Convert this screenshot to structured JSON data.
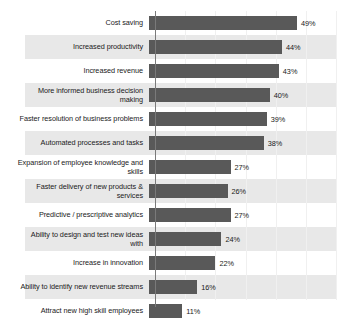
{
  "chart_data": {
    "type": "bar",
    "orientation": "horizontal",
    "title": "",
    "subtitle": "",
    "xlabel": "",
    "ylabel": "",
    "xlim": [
      0,
      60
    ],
    "grid": true,
    "legend": false,
    "value_suffix": "%",
    "categories": [
      "Cost saving",
      "Increased productivity",
      "Increased revenue",
      "More informed business decision making",
      "Faster resolution of business problems",
      "Automated processes and tasks",
      "Expansion of employee knowledge and skills",
      "Faster delivery of new products & services",
      "Predictive / prescriptive analytics",
      "Ability to design and test new ideas with",
      "Increase in innovation",
      "Ability to identify new revenue streams",
      "Attract new high skill employees"
    ],
    "values": [
      49,
      44,
      43,
      40,
      39,
      38,
      27,
      26,
      27,
      24,
      22,
      16,
      11
    ],
    "value_labels": [
      "49%",
      "44%",
      "43%",
      "40%",
      "39%",
      "38%",
      "27%",
      "26%",
      "27%",
      "24%",
      "22%",
      "16%",
      "11%"
    ],
    "category_lines": [
      [
        "Cost saving"
      ],
      [
        "Increased productivity"
      ],
      [
        "Increased revenue"
      ],
      [
        "More informed business decision",
        "making"
      ],
      [
        "Faster resolution of business problems"
      ],
      [
        "Automated processes and tasks"
      ],
      [
        "Expansion of employee knowledge and",
        "skills"
      ],
      [
        "Faster delivery of new products &",
        "services"
      ],
      [
        "Predictive / prescriptive analytics"
      ],
      [
        "Ability to design and test new ideas",
        "with"
      ],
      [
        "Increase in innovation"
      ],
      [
        "Ability to identify new revenue streams"
      ],
      [
        "Attract new high skill employees"
      ]
    ],
    "colors": {
      "bar": "#595959",
      "band": "#e8e8e8",
      "background": "#ffffff",
      "axis": "#7a7a7a",
      "gridline": "#f0f0f0",
      "text": "#1a1a1a"
    }
  }
}
